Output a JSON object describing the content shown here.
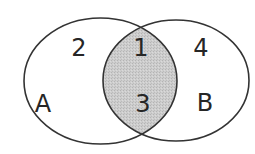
{
  "diagram": {
    "type": "venn",
    "sets": [
      {
        "id": "A",
        "label": "A"
      },
      {
        "id": "B",
        "label": "B"
      }
    ],
    "regions": [
      {
        "id": "A_only",
        "label": "2",
        "shaded": false
      },
      {
        "id": "A_and_B_top",
        "label": "1",
        "shaded": true
      },
      {
        "id": "A_and_B_bottom",
        "label": "3",
        "shaded": true
      },
      {
        "id": "B_only",
        "label": "4",
        "shaded": false
      }
    ],
    "shaded_region": "A ∩ B",
    "colors": {
      "stroke": "#333333",
      "shade": "#c8c8c8",
      "background": "#ffffff",
      "text": "#262626"
    }
  }
}
